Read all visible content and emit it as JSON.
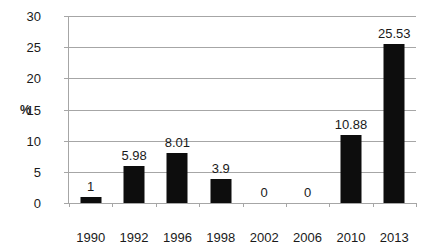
{
  "chart_data": {
    "type": "bar",
    "title": "",
    "subtitle": "",
    "xlabel": "",
    "ylabel": "%",
    "categories": [
      "1990",
      "1992",
      "1996",
      "1998",
      "2002",
      "2006",
      "2010",
      "2013"
    ],
    "values": [
      1,
      5.98,
      8.01,
      3.9,
      0,
      0,
      10.88,
      25.53
    ],
    "value_labels": [
      "1",
      "5.98",
      "8.01",
      "3.9",
      "0",
      "0",
      "10.88",
      "25.53"
    ],
    "series": [
      {
        "name": "%",
        "values": [
          1,
          5.98,
          8.01,
          3.9,
          0,
          0,
          10.88,
          25.53
        ]
      }
    ],
    "ylim": [
      0,
      30
    ],
    "yticks": [
      0,
      5,
      10,
      15,
      20,
      25,
      30
    ],
    "ytick_labels": [
      "0",
      "5",
      "10",
      "15",
      "20",
      "25",
      "30"
    ],
    "grid": "horizontal",
    "legend": "none",
    "bar_color": "#0d0d0d",
    "grid_color": "#a6a6a6",
    "axis_color": "#a6a6a6",
    "text_color": "#1a1a1a",
    "background": "#ffffff",
    "data_labels_shown": true
  }
}
